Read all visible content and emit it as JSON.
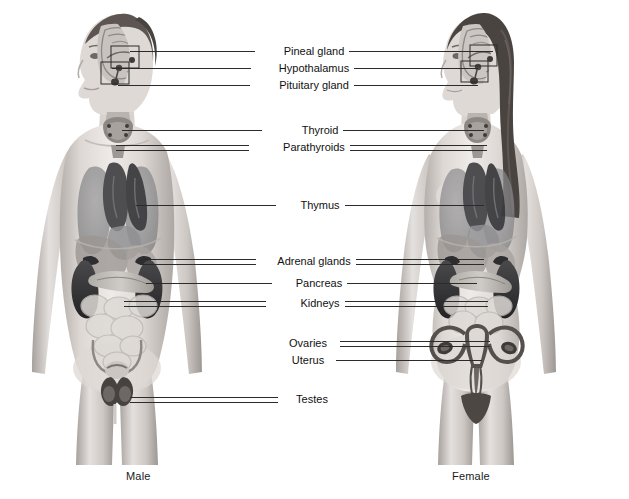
{
  "figure_title": "Endocrine system glands in male and female body",
  "captions": {
    "male": "Male",
    "female": "Female"
  },
  "labels": [
    {
      "id": "pineal-gland",
      "text": "Pineal gland",
      "y": 51,
      "has_left_line": true,
      "has_right_line": true,
      "paired": false
    },
    {
      "id": "hypothalamus",
      "text": "Hypothalamus",
      "y": 68,
      "has_left_line": true,
      "has_right_line": true,
      "paired": false
    },
    {
      "id": "pituitary-gland",
      "text": "Pituitary gland",
      "y": 85,
      "has_left_line": true,
      "has_right_line": true,
      "paired": false
    },
    {
      "id": "thyroid",
      "text": "Thyroid",
      "y": 130,
      "has_left_line": true,
      "has_right_line": true,
      "paired": false
    },
    {
      "id": "parathyroids",
      "text": "Parathyroids",
      "y": 147,
      "has_left_line": true,
      "has_right_line": true,
      "paired": true
    },
    {
      "id": "thymus",
      "text": "Thymus",
      "y": 205,
      "has_left_line": true,
      "has_right_line": true,
      "paired": false
    },
    {
      "id": "adrenal-glands",
      "text": "Adrenal glands",
      "y": 261,
      "has_left_line": true,
      "has_right_line": true,
      "paired": true
    },
    {
      "id": "pancreas",
      "text": "Pancreas",
      "y": 283,
      "has_left_line": true,
      "has_right_line": true,
      "paired": false
    },
    {
      "id": "kidneys",
      "text": "Kidneys",
      "y": 303,
      "has_left_line": true,
      "has_right_line": true,
      "paired": true
    },
    {
      "id": "ovaries",
      "text": "Ovaries",
      "y": 343,
      "has_left_line": false,
      "has_right_line": true,
      "paired": true
    },
    {
      "id": "uterus",
      "text": "Uterus",
      "y": 360,
      "has_left_line": false,
      "has_right_line": true,
      "paired": false
    },
    {
      "id": "testes",
      "text": "Testes",
      "y": 399,
      "has_left_line": true,
      "has_right_line": false,
      "paired": true
    }
  ],
  "colors": {
    "background": "#ffffff",
    "leader_line": "#2b2b2b",
    "label_text": "#111111",
    "skin_light": "#e8e4e1",
    "skin_mid": "#cfc9c5",
    "skin_shadow": "#a8a19c",
    "organ_dark": "#3a3a3c",
    "organ_mid": "#6e6e70",
    "organ_light": "#b9b5b2",
    "hair_dark": "#4a4441"
  }
}
